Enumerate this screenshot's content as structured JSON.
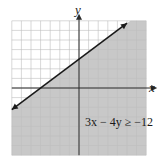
{
  "chart_data": {
    "type": "line",
    "title": "",
    "xlabel": "x",
    "ylabel": "y",
    "xlim": [
      -7,
      7
    ],
    "ylim": [
      -7,
      7
    ],
    "grid": true,
    "grid_step": 1,
    "tick_labels": false,
    "inequality": "3x − 4y ≥ −12",
    "boundary_line": {
      "equation": "3x - 4y = -12",
      "slope": 0.75,
      "y_intercept": 3,
      "x_intercept": -4,
      "style": "solid",
      "arrows": "both",
      "points": [
        [
          -7,
          -2.25
        ],
        [
          5,
          6.75
        ]
      ]
    },
    "shaded_region": "below line (y ≤ 0.75x + 3)",
    "colors": {
      "shade": "#c8c8c8",
      "grid": "#9a9a9a",
      "grid_unshaded": "#bdbdbd",
      "line": "#1a1a1a",
      "axes": "#2a2a2a"
    }
  },
  "labels": {
    "x_axis": "x",
    "y_axis": "y",
    "annotation": "3x − 4y ≥ −12"
  }
}
